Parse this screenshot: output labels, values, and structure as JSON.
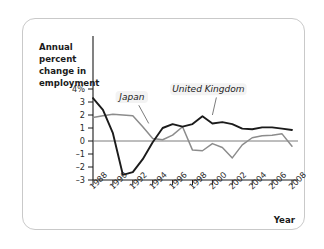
{
  "figure": {
    "background_color": "#ffffff",
    "border_color": "#c9c9c9"
  },
  "chart_data": {
    "type": "line",
    "title": "",
    "ylabel": "Annual percent change in employment",
    "xlabel": "Year",
    "xlim": [
      1988,
      2008
    ],
    "ylim": [
      -3,
      4
    ],
    "yticks": [
      "4%",
      "3",
      "2",
      "1",
      "0",
      "-1",
      "-2",
      "-3"
    ],
    "ytick_values": [
      4,
      3,
      2,
      1,
      0,
      -1,
      -2,
      -3
    ],
    "xticks": [
      "1988",
      "1990",
      "1992",
      "1994",
      "1996",
      "1998",
      "2000",
      "2002",
      "2004",
      "2006",
      "2008"
    ],
    "xtick_values": [
      1988,
      1990,
      1992,
      1994,
      1996,
      1998,
      2000,
      2002,
      2004,
      2006,
      2008
    ],
    "grid": false,
    "legend_position": "inline-annotation",
    "zero_reference_line": 0,
    "x": [
      1988,
      1989,
      1990,
      1991,
      1992,
      1993,
      1994,
      1995,
      1996,
      1997,
      1998,
      1999,
      2000,
      2001,
      2002,
      2003,
      2004,
      2005,
      2006,
      2007,
      2008
    ],
    "series": [
      {
        "name": "Japan",
        "color": "#8c8c8c",
        "values": [
          1.8,
          1.95,
          2.05,
          2.0,
          1.95,
          1.1,
          0.2,
          0.1,
          0.45,
          1.1,
          -0.7,
          -0.75,
          -0.2,
          -0.5,
          -1.3,
          -0.3,
          0.25,
          0.4,
          0.45,
          0.55,
          -0.4
        ]
      },
      {
        "name": "United Kingdom",
        "color": "#1b1b1b",
        "values": [
          3.3,
          2.4,
          0.6,
          -2.6,
          -2.4,
          -1.4,
          -0.1,
          1.0,
          1.3,
          1.1,
          1.3,
          1.9,
          1.35,
          1.45,
          1.3,
          0.95,
          0.9,
          1.05,
          1.05,
          0.95,
          0.85
        ]
      }
    ],
    "annotations": [
      {
        "label": "Japan",
        "x": 1991.9,
        "y": 3.15
      },
      {
        "label": "United Kingdom",
        "x": 1999.6,
        "y": 3.75
      }
    ]
  }
}
